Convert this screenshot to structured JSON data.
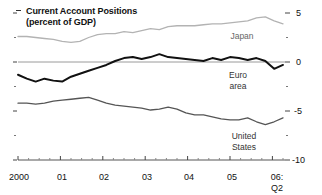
{
  "chart_data": {
    "type": "line",
    "title": "Current Account Positions",
    "subtitle": "(percent of GDP)",
    "xlabel": "",
    "ylabel": "",
    "ylim": [
      -10,
      5
    ],
    "yticks": [
      5,
      0,
      -5,
      -10
    ],
    "ytick_labels": [
      "5",
      "0",
      "-5",
      "-10"
    ],
    "yminor_ticks": [
      2.5,
      -2.5,
      -7.5
    ],
    "grid": false,
    "zero_line": 0,
    "legend_position": "inline-right",
    "xticks": [
      "2000",
      "01",
      "02",
      "03",
      "04",
      "05",
      "06:"
    ],
    "xtick_sublabel": "Q2",
    "x_minor_interval": "quarterly",
    "x_start": 2000.0,
    "x_end": 2006.25,
    "series": [
      {
        "name": "Japan",
        "color": "#b3b3b3",
        "label": "Japan",
        "values": [
          2.6,
          2.6,
          2.5,
          2.4,
          2.3,
          2.1,
          2.0,
          2.1,
          2.5,
          2.8,
          2.9,
          2.9,
          3.1,
          3.0,
          3.2,
          3.4,
          3.3,
          3.6,
          3.7,
          3.7,
          3.7,
          3.8,
          3.9,
          3.9,
          4.0,
          4.1,
          4.2,
          4.5,
          4.6,
          4.2,
          3.9
        ]
      },
      {
        "name": "Euro area",
        "color": "#111111",
        "label": "Euro\narea",
        "label_line1": "Euro",
        "label_line2": "area",
        "values": [
          -1.3,
          -1.7,
          -2.0,
          -1.7,
          -1.9,
          -2.0,
          -1.5,
          -1.2,
          -0.9,
          -0.6,
          -0.3,
          0.1,
          0.4,
          0.5,
          0.3,
          0.5,
          0.8,
          0.5,
          0.4,
          0.3,
          0.2,
          0.1,
          0.4,
          0.2,
          0.5,
          0.4,
          0.2,
          0.4,
          0.1,
          -0.7,
          -0.3
        ]
      },
      {
        "name": "United States",
        "color": "#555555",
        "label": "United\nStates",
        "label_line1": "United",
        "label_line2": "States",
        "values": [
          -4.2,
          -4.2,
          -4.3,
          -4.2,
          -4.0,
          -3.9,
          -3.8,
          -3.7,
          -3.6,
          -3.9,
          -4.2,
          -4.4,
          -4.5,
          -4.6,
          -4.7,
          -4.9,
          -4.8,
          -4.6,
          -4.8,
          -5.2,
          -5.4,
          -5.4,
          -5.6,
          -5.8,
          -5.9,
          -5.9,
          -5.7,
          -6.1,
          -6.4,
          -6.1,
          -5.7
        ]
      }
    ]
  }
}
